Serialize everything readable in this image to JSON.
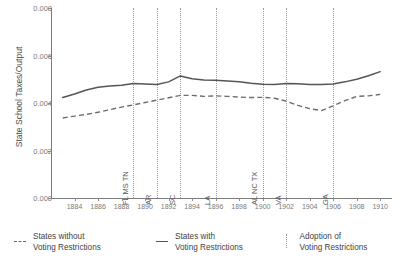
{
  "chart_data": {
    "type": "line",
    "title": "",
    "subtitle": "",
    "xlabel": "",
    "ylabel": "State School Taxes/Output",
    "xlim": [
      1882,
      1911
    ],
    "ylim": [
      0.0,
      0.008
    ],
    "grid": false,
    "legend_position": "bottom",
    "y_ticks": [
      "0.000",
      "0.002",
      "0.004",
      "0.006",
      "0.008"
    ],
    "y_tick_values": [
      0.0,
      0.002,
      0.004,
      0.006,
      0.008
    ],
    "x_ticks": [
      "1884",
      "1886",
      "1888",
      "1890",
      "1892",
      "1894",
      "1896",
      "1898",
      "1900",
      "1902",
      "1904",
      "1906",
      "1908",
      "1910"
    ],
    "x_tick_values": [
      1884,
      1886,
      1888,
      1890,
      1892,
      1894,
      1896,
      1898,
      1900,
      1902,
      1904,
      1906,
      1908,
      1910
    ],
    "x": [
      1883,
      1884,
      1885,
      1886,
      1887,
      1888,
      1889,
      1890,
      1891,
      1892,
      1893,
      1894,
      1895,
      1896,
      1897,
      1898,
      1899,
      1900,
      1901,
      1902,
      1903,
      1904,
      1905,
      1906,
      1907,
      1908,
      1909,
      1910
    ],
    "series": [
      {
        "name": "States with Voting Restrictions",
        "style": "solid",
        "color": "#555555",
        "values": [
          0.00423,
          0.00438,
          0.00455,
          0.00466,
          0.00472,
          0.00475,
          0.00482,
          0.0048,
          0.00478,
          0.00489,
          0.00514,
          0.00502,
          0.00497,
          0.00496,
          0.00493,
          0.00489,
          0.00483,
          0.00479,
          0.00478,
          0.00482,
          0.00481,
          0.00478,
          0.00478,
          0.0048,
          0.00489,
          0.005,
          0.00515,
          0.00532
        ]
      },
      {
        "name": "States without Voting Restrictions",
        "style": "dashed",
        "color": "#6b6b6b",
        "values": [
          0.00337,
          0.00345,
          0.00352,
          0.00361,
          0.00372,
          0.00383,
          0.00392,
          0.00402,
          0.00412,
          0.00422,
          0.00432,
          0.00432,
          0.00428,
          0.0043,
          0.00428,
          0.00425,
          0.00423,
          0.00424,
          0.0042,
          0.00408,
          0.0039,
          0.00376,
          0.00368,
          0.00388,
          0.0041,
          0.00428,
          0.0043,
          0.00436
        ]
      }
    ],
    "vlines": [
      {
        "year": 1889,
        "label": "FL MS TN",
        "label_y_px": 196
      },
      {
        "year": 1891,
        "label": "AR",
        "label_y_px": 196
      },
      {
        "year": 1893,
        "label": "SC",
        "label_y_px": 196
      },
      {
        "year": 1896,
        "label": "LA",
        "label_y_px": 196
      },
      {
        "year": 1900,
        "label": "AL NC TX",
        "label_y_px": 196
      },
      {
        "year": 1902,
        "label": "VA",
        "label_y_px": 196
      },
      {
        "year": 1906,
        "label": "GA",
        "label_y_px": 196
      }
    ],
    "vline_style": "dotted",
    "vline_color": "#9a9a9a"
  },
  "legend": {
    "items": [
      {
        "label_line1": "States without",
        "label_line2": "Voting Restrictions",
        "key": "dashed-line-key"
      },
      {
        "label_line1": "States with",
        "label_line2": "Voting Restrictions",
        "key": "solid-line-key"
      },
      {
        "label_line1": "Adoption of",
        "label_line2": "Voting Restrictions",
        "key": "dotted-line-key"
      }
    ]
  },
  "colors": {
    "background": "#ffffff",
    "axis": "#7d7d7d",
    "tick_text": "#7a7a7a",
    "label_text": "#4d4d4d",
    "solid_series": "#555555",
    "dashed_series": "#6b6b6b",
    "vline": "#9a9a9a"
  }
}
